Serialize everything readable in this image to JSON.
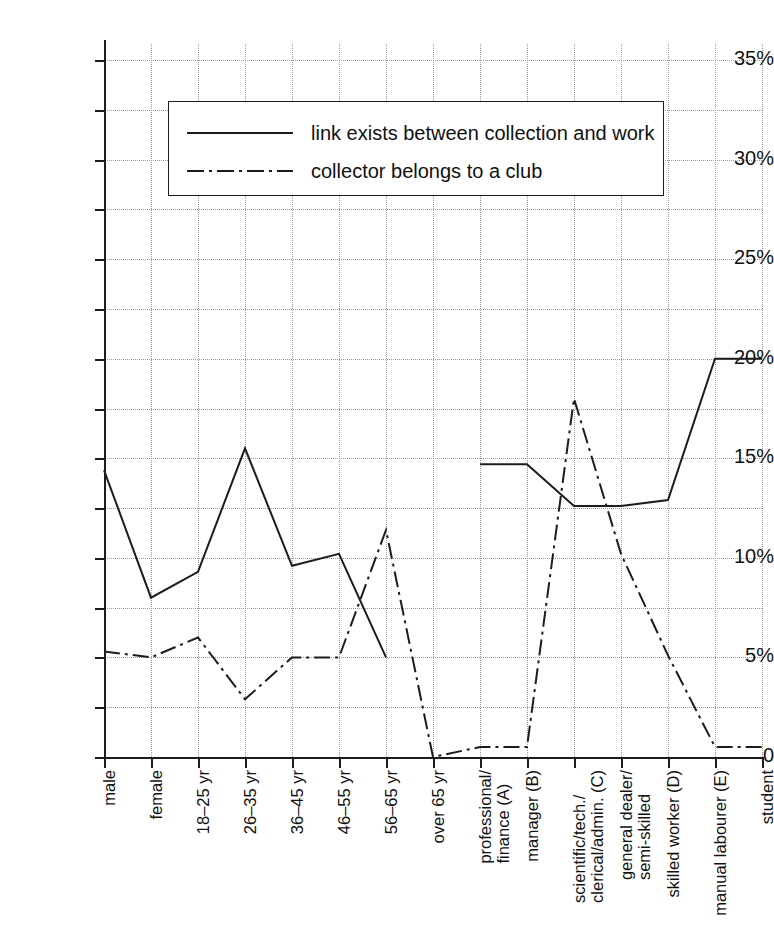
{
  "chart_data": {
    "type": "line",
    "title": "",
    "xlabel": "",
    "ylabel": "",
    "ylim": [
      0,
      35
    ],
    "yticks": [
      0,
      5,
      10,
      15,
      20,
      25,
      30,
      35
    ],
    "ytick_labels": [
      "0",
      "5%",
      "10%",
      "15%",
      "20%",
      "25%",
      "30%",
      "35%"
    ],
    "minor_gridlines": [
      2.5,
      7.5,
      12.5,
      17.5,
      22.5,
      27.5,
      32.5
    ],
    "grid": true,
    "legend_position": "upper-left-inside",
    "categories": [
      "male",
      "female",
      "18–25 yr",
      "26–35 yr",
      "36–45 yr",
      "46–55 yr",
      "56–65 yr",
      "over 65 yr",
      "professional/ finance (A)",
      "manager (B)",
      "scientific/tech./ clerical/admin. (C)",
      "general dealer/ semi-skilled",
      "skilled worker (D)",
      "manual labourer (E)",
      "student"
    ],
    "category_lines": [
      [
        "male"
      ],
      [
        "female"
      ],
      [
        "18–25 yr"
      ],
      [
        "26–35 yr"
      ],
      [
        "36–45 yr"
      ],
      [
        "46–55 yr"
      ],
      [
        "56–65 yr"
      ],
      [
        "over 65 yr"
      ],
      [
        "professional/",
        "finance (A)"
      ],
      [
        "manager (B)"
      ],
      [
        "scientific/tech./",
        "clerical/admin. (C)"
      ],
      [
        "general dealer/",
        "semi-skilled"
      ],
      [
        "skilled worker (D)"
      ],
      [
        "manual labourer (E)"
      ],
      [
        "student"
      ]
    ],
    "series": [
      {
        "name": "link exists between collection and work",
        "style": "solid",
        "values": [
          14.4,
          8.0,
          9.3,
          15.5,
          9.6,
          10.2,
          5.0,
          null,
          14.7,
          14.7,
          12.6,
          12.6,
          12.9,
          20.0,
          20.0
        ]
      },
      {
        "name": "collector belongs to a club",
        "style": "dash-dot",
        "values": [
          5.3,
          5.0,
          6.0,
          2.9,
          5.0,
          5.0,
          11.4,
          0.0,
          0.5,
          0.5,
          18.0,
          10.2,
          5.1,
          0.5,
          0.5
        ]
      }
    ]
  },
  "legend": {
    "items": [
      {
        "label": "link exists between collection and work",
        "style": "solid"
      },
      {
        "label": "collector belongs to a club",
        "style": "dash-dot"
      }
    ]
  },
  "colors": {
    "axis": "#1c1c1c",
    "grid": "#9a9a9a",
    "series_solid": "#1c1c1c",
    "series_dashdot": "#1c1c1c",
    "background": "#ffffff"
  }
}
